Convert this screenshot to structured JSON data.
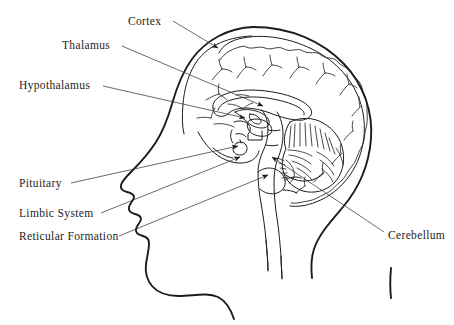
{
  "figure": {
    "background_color": "#ffffff",
    "line_color": "#1c1c1c",
    "label_color": "#1c1c1c",
    "width": 454,
    "height": 325
  },
  "labels": [
    {
      "id": "cortex",
      "text": "Cortex",
      "x": 128,
      "y": 16,
      "anchor": "left",
      "leader": {
        "from_x": 173,
        "from_y": 21,
        "to_x": 218,
        "to_y": 48,
        "arrow": true
      }
    },
    {
      "id": "thalamus",
      "text": "Thalamus",
      "x": 62,
      "y": 40,
      "anchor": "left",
      "leader": {
        "from_x": 122,
        "from_y": 46,
        "to_x": 263,
        "to_y": 106,
        "arrow": true
      }
    },
    {
      "id": "hypothalamus",
      "text": "Hypothalamus",
      "x": 19,
      "y": 80,
      "anchor": "left",
      "leader": {
        "from_x": 103,
        "from_y": 86,
        "to_x": 245,
        "to_y": 118,
        "arrow": true
      }
    },
    {
      "id": "pituitary",
      "text": "Pituitary",
      "x": 19,
      "y": 178,
      "anchor": "left",
      "leader": {
        "from_x": 71,
        "from_y": 183,
        "to_x": 238,
        "to_y": 146,
        "arrow": true
      }
    },
    {
      "id": "limbic-system",
      "text": "Limbic System",
      "x": 19,
      "y": 208,
      "anchor": "left",
      "leader": {
        "from_x": 101,
        "from_y": 213,
        "to_x": 240,
        "to_y": 157,
        "arrow": true
      }
    },
    {
      "id": "reticular-formation",
      "text": "Reticular Formation",
      "x": 19,
      "y": 231,
      "anchor": "left",
      "leader": {
        "from_x": 119,
        "from_y": 236,
        "to_x": 268,
        "to_y": 175,
        "arrow": true
      }
    },
    {
      "id": "cerebellum",
      "text": "Cerebellum",
      "x": 388,
      "y": 230,
      "anchor": "left",
      "leader": {
        "from_x": 384,
        "from_y": 232,
        "to_x": 272,
        "to_y": 157,
        "arrow": true
      }
    }
  ],
  "structures": [
    {
      "id": "head-profile",
      "name": "head-and-face-outline"
    },
    {
      "id": "neck",
      "name": "neck-outline"
    },
    {
      "id": "skull-inner",
      "name": "skull-inner-outline"
    },
    {
      "id": "cerebral-cortex",
      "name": "cerebral-cortex-outline"
    },
    {
      "id": "gyri",
      "name": "cortical-gyri-folds"
    },
    {
      "id": "corpus-callosum",
      "name": "corpus-callosum"
    },
    {
      "id": "thalamus-body",
      "name": "thalamus-body"
    },
    {
      "id": "hypothalamus-body",
      "name": "hypothalamus-body"
    },
    {
      "id": "pituitary-gland",
      "name": "pituitary-gland"
    },
    {
      "id": "brainstem",
      "name": "brainstem-and-medulla"
    },
    {
      "id": "cerebellum-body",
      "name": "cerebellum-arbor-vitae"
    },
    {
      "id": "spinal-cord",
      "name": "spinal-cord"
    }
  ]
}
